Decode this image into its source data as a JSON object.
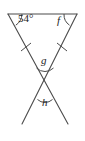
{
  "figure": {
    "stroke_color": "#4a4a4a",
    "label_color": "#1a1a1a",
    "background_color": "#ffffff",
    "width": 85,
    "height": 141
  },
  "labels": {
    "angle_top_left": "54°",
    "angle_top_right": "f",
    "angle_middle": "g",
    "angle_bottom": "h"
  },
  "geometry": {
    "top_segment": {
      "x1": 8,
      "y1": 14,
      "x2": 77,
      "y2": 14
    },
    "line_from_top_left": {
      "x1": 8,
      "y1": 14,
      "x2": 68,
      "y2": 124
    },
    "line_from_top_right": {
      "x1": 77,
      "y1": 14,
      "x2": 22,
      "y2": 124
    },
    "intersection_upper": {
      "x": 45,
      "y": 77
    },
    "intersection_lower": {
      "x": 45,
      "y": 92
    },
    "tick_left": {
      "x": 26,
      "y": 47
    },
    "tick_right": {
      "x": 62,
      "y": 47
    }
  },
  "arcs": {
    "angle_top_left_arc": "arc at top-left vertex between horizontal segment and descending line",
    "angle_top_right_arc": "arc at top-right vertex between horizontal segment and descending line",
    "angle_middle_arc": "arc below label g at upper intersection, opening downward",
    "angle_bottom_arc": "arc below label h at lower intersection, opening downward"
  },
  "tick_marks": {
    "count": 2,
    "meaning": "congruent-segment hash marks"
  }
}
